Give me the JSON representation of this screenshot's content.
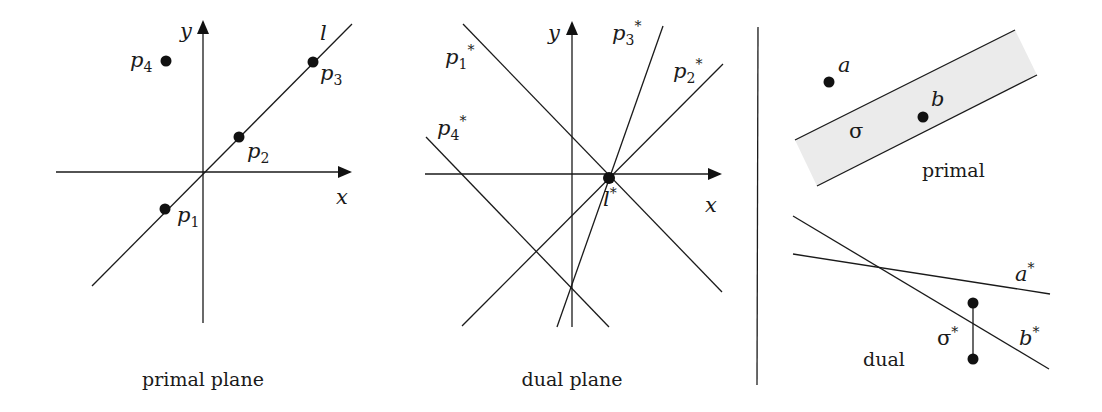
{
  "primal_plane": {
    "caption": "primal plane",
    "axis_x_label": "x",
    "axis_y_label": "y",
    "line_label": "l",
    "points": [
      {
        "name": "p",
        "sub": "1",
        "x": 165,
        "y": 209,
        "lx": 177,
        "ly": 222
      },
      {
        "name": "p",
        "sub": "2",
        "x": 239,
        "y": 137,
        "lx": 247,
        "ly": 158
      },
      {
        "name": "p",
        "sub": "3",
        "x": 313,
        "y": 62,
        "lx": 320,
        "ly": 80
      },
      {
        "name": "p",
        "sub": "4",
        "x": 166,
        "y": 61,
        "lx": 130,
        "ly": 67
      }
    ]
  },
  "dual_plane": {
    "caption": "dual plane",
    "axis_x_label": "x",
    "axis_y_label": "y",
    "intersection_label": "l",
    "intersection_sup": "*",
    "lines": [
      {
        "name": "p",
        "sub": "1",
        "sup": "*",
        "x1": 463,
        "y1": 24,
        "x2": 722,
        "y2": 292,
        "lx": 445,
        "ly": 64
      },
      {
        "name": "p",
        "sub": "2",
        "sup": "*",
        "x1": 723,
        "y1": 64,
        "x2": 462,
        "y2": 326,
        "lx": 673,
        "ly": 78
      },
      {
        "name": "p",
        "sub": "3",
        "sup": "*",
        "x1": 663,
        "y1": 26,
        "x2": 557,
        "y2": 327,
        "lx": 612,
        "ly": 40
      },
      {
        "name": "p",
        "sub": "4",
        "sup": "*",
        "x1": 426,
        "y1": 137,
        "x2": 609,
        "y2": 327,
        "lx": 437,
        "ly": 135
      }
    ]
  },
  "right_panel": {
    "primal_label": "primal",
    "dual_label": "dual",
    "sigma_label": "σ",
    "sigma_star_label": "σ",
    "star": "*",
    "point_a_label": "a",
    "point_b_label": "b",
    "line_a_star_label": "a",
    "line_b_star_label": "b",
    "band_fill": "#ebebeb"
  }
}
